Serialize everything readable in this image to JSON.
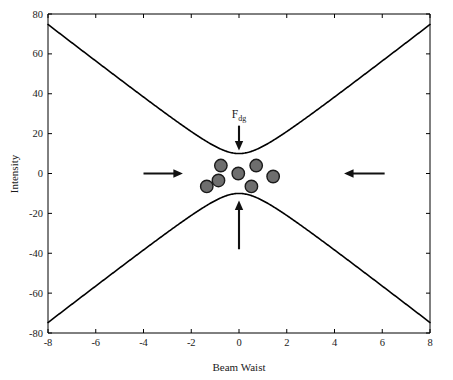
{
  "chart_data": {
    "type": "line",
    "title": "",
    "xlabel": "Beam Waist",
    "ylabel": "Intensity",
    "xlim": [
      -8,
      8
    ],
    "ylim": [
      -80,
      80
    ],
    "xticks": [
      -8,
      -6,
      -4,
      -2,
      0,
      2,
      4,
      6,
      8
    ],
    "yticks": [
      -80,
      -60,
      -40,
      -20,
      0,
      20,
      40,
      60,
      80
    ],
    "xtick_labels": [
      "-8",
      "-6",
      "-4",
      "-2",
      "0",
      "2",
      "4",
      "6",
      "8"
    ],
    "ytick_labels": [
      "-80",
      "-60",
      "-40",
      "-20",
      "0",
      "20",
      "40",
      "60",
      "80"
    ],
    "grid": false,
    "legend": "none",
    "waist_radius": 10,
    "series": [
      {
        "name": "upper beam envelope",
        "comment": "hyperbola w(x) = +10*sqrt(1+(x/1.08)^2), upper branch of focused gaussian beam",
        "x": [
          -8,
          -7,
          -6,
          -5,
          -4,
          -3,
          -2,
          -1,
          0,
          1,
          2,
          3,
          4,
          5,
          6,
          7,
          8
        ],
        "y": [
          74.7,
          65.4,
          56.2,
          47.0,
          37.9,
          28.9,
          20.3,
          14.7,
          10.0,
          14.7,
          20.3,
          28.9,
          37.9,
          47.0,
          56.2,
          65.4,
          74.7
        ]
      },
      {
        "name": "lower beam envelope",
        "comment": "hyperbola w(x) = -10*sqrt(1+(x/1.08)^2), lower branch",
        "x": [
          -8,
          -7,
          -6,
          -5,
          -4,
          -3,
          -2,
          -1,
          0,
          1,
          2,
          3,
          4,
          5,
          6,
          7,
          8
        ],
        "y": [
          -74.7,
          -65.4,
          -56.2,
          -47.0,
          -37.9,
          -28.9,
          -20.3,
          -14.7,
          -10.0,
          -14.7,
          -20.3,
          -28.9,
          -37.9,
          -47.0,
          -56.2,
          -65.4,
          -74.7
        ]
      }
    ],
    "particles": {
      "name": "trapped particles",
      "count": 7,
      "fill_color": "#6e6e6e",
      "edge_color": "#1a1a1a",
      "radius_data_x": 0.26,
      "points": [
        {
          "x": -0.76,
          "y": 4.0
        },
        {
          "x": -0.86,
          "y": -3.5
        },
        {
          "x": -1.35,
          "y": -6.5
        },
        {
          "x": -0.03,
          "y": 0.0
        },
        {
          "x": 0.72,
          "y": 4.0
        },
        {
          "x": 0.52,
          "y": -6.5
        },
        {
          "x": 1.43,
          "y": -1.5
        }
      ]
    },
    "annotations": [
      {
        "name": "gradient-force-label",
        "text": "F",
        "subscript": "dg",
        "x": 0.0,
        "y": 28.0
      },
      {
        "name": "gradient-force-arrow-down",
        "type": "arrow",
        "direction": "down",
        "x": 0.0,
        "y_from": 24.0,
        "y_to": 11.5
      },
      {
        "name": "gradient-force-arrow-up",
        "type": "arrow",
        "direction": "up",
        "x": 0.0,
        "y_from": -38.0,
        "y_to": -13.5
      },
      {
        "name": "scattering-force-arrow-right",
        "type": "arrow",
        "direction": "right",
        "y": 0.0,
        "x_from": -4.0,
        "x_to": -2.35
      },
      {
        "name": "scattering-force-arrow-left",
        "type": "arrow",
        "direction": "left",
        "y": 0.0,
        "x_from": 6.1,
        "x_to": 4.4
      }
    ],
    "colors": {
      "curve": "#000000",
      "axis": "#000000",
      "text": "#1a1a1a",
      "particle_fill": "#6e6e6e",
      "particle_edge": "#1a1a1a",
      "background": "#ffffff"
    }
  }
}
